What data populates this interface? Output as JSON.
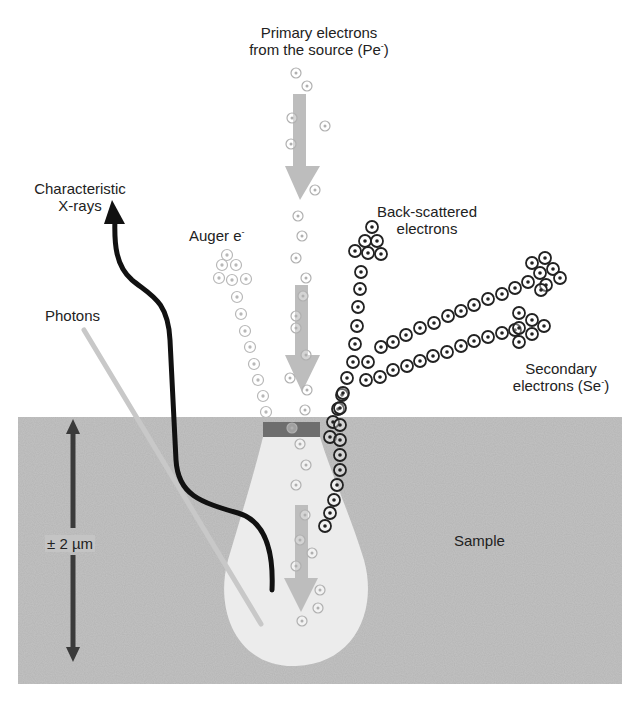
{
  "colors": {
    "background": "#ffffff",
    "sample": "#c4c4c4",
    "interaction_volume": "#ececec",
    "surface_strip": "#6e6e6e",
    "beam_arrow": "#bdbdbd",
    "scale_arrow": "#3a3a3a",
    "xray_path": "#111111",
    "photon_line": "#c8c8c8",
    "primary_electron": "#b0b0b0",
    "auger_electron": "#b8b8b8",
    "backscatter_electron": "#222222",
    "secondary_electron": "#222222",
    "text": "#222222"
  },
  "labels": {
    "primary": {
      "line1": "Primary electrons",
      "line2": "from the source (Pe",
      "sup": "-",
      "close": ")"
    },
    "xrays": {
      "line1": "Characteristic",
      "line2": "X-rays"
    },
    "auger": {
      "text": "Auger e",
      "sup": "-"
    },
    "backscattered": {
      "line1": "Back-scattered",
      "line2": "electrons"
    },
    "photons": {
      "text": "Photons"
    },
    "secondary": {
      "line1": "Secondary",
      "line2": "electrons (Se",
      "sup": "-",
      "close": ")"
    },
    "scale": {
      "text": "± 2 µm"
    },
    "sample": {
      "text": "Sample"
    }
  },
  "geometry": {
    "sample_box": {
      "x": 18,
      "y": 417,
      "w": 604,
      "h": 267
    },
    "surface_strip": {
      "x": 263,
      "y": 422,
      "w": 57,
      "h": 15
    },
    "scale_arrow": {
      "x": 73,
      "y1": 420,
      "y2": 662
    }
  },
  "electrons": {
    "primary": [
      [
        296,
        73
      ],
      [
        307,
        86
      ],
      [
        292,
        118
      ],
      [
        325,
        126
      ],
      [
        291,
        144
      ],
      [
        315,
        190
      ],
      [
        298,
        216
      ],
      [
        302,
        236
      ],
      [
        296,
        258
      ],
      [
        306,
        278
      ],
      [
        303,
        296
      ],
      [
        296,
        316
      ],
      [
        296,
        328
      ],
      [
        306,
        355
      ],
      [
        290,
        378
      ],
      [
        307,
        390
      ],
      [
        305,
        410
      ],
      [
        292,
        428
      ],
      [
        300,
        444
      ],
      [
        306,
        465
      ],
      [
        296,
        485
      ],
      [
        305,
        515
      ],
      [
        300,
        540
      ],
      [
        312,
        553
      ],
      [
        296,
        566
      ],
      [
        320,
        590
      ],
      [
        302,
        621
      ],
      [
        318,
        608
      ]
    ],
    "auger": [
      [
        227,
        255
      ],
      [
        222,
        265
      ],
      [
        236,
        265
      ],
      [
        219,
        278
      ],
      [
        232,
        280
      ],
      [
        246,
        279
      ],
      [
        237,
        297
      ],
      [
        241,
        314
      ],
      [
        245,
        331
      ],
      [
        250,
        347
      ],
      [
        254,
        364
      ],
      [
        258,
        380
      ],
      [
        263,
        396
      ],
      [
        266,
        412
      ]
    ],
    "backscatter": [
      [
        372,
        227
      ],
      [
        365,
        241
      ],
      [
        377,
        241
      ],
      [
        355,
        251
      ],
      [
        368,
        253
      ],
      [
        381,
        254
      ],
      [
        361,
        272
      ],
      [
        360,
        289
      ],
      [
        358,
        307
      ],
      [
        357,
        326
      ],
      [
        355,
        344
      ],
      [
        353,
        362
      ],
      [
        347,
        378
      ],
      [
        342,
        395
      ],
      [
        338,
        409
      ],
      [
        333,
        422
      ],
      [
        330,
        437
      ],
      [
        343,
        393
      ],
      [
        340,
        408
      ],
      [
        340,
        425
      ],
      [
        340,
        440
      ],
      [
        340,
        455
      ],
      [
        340,
        470
      ],
      [
        337,
        485
      ],
      [
        334,
        500
      ],
      [
        330,
        513
      ],
      [
        325,
        526
      ]
    ],
    "secondary_upper": [
      [
        368,
        362
      ],
      [
        381,
        347
      ],
      [
        393,
        342
      ],
      [
        406,
        335
      ],
      [
        420,
        328
      ],
      [
        434,
        323
      ],
      [
        448,
        316
      ],
      [
        461,
        311
      ],
      [
        474,
        305
      ],
      [
        488,
        299
      ],
      [
        502,
        294
      ],
      [
        515,
        288
      ],
      [
        528,
        282
      ],
      [
        540,
        273
      ],
      [
        553,
        269
      ],
      [
        546,
        285
      ],
      [
        532,
        263
      ],
      [
        545,
        258
      ],
      [
        560,
        278
      ],
      [
        541,
        290
      ]
    ],
    "secondary_lower": [
      [
        366,
        380
      ],
      [
        380,
        377
      ],
      [
        393,
        370
      ],
      [
        407,
        366
      ],
      [
        420,
        361
      ],
      [
        433,
        356
      ],
      [
        447,
        352
      ],
      [
        461,
        346
      ],
      [
        474,
        341
      ],
      [
        488,
        337
      ],
      [
        502,
        333
      ],
      [
        515,
        330
      ],
      [
        519,
        313
      ],
      [
        532,
        320
      ],
      [
        519,
        328
      ],
      [
        532,
        334
      ],
      [
        519,
        342
      ],
      [
        544,
        326
      ]
    ]
  }
}
